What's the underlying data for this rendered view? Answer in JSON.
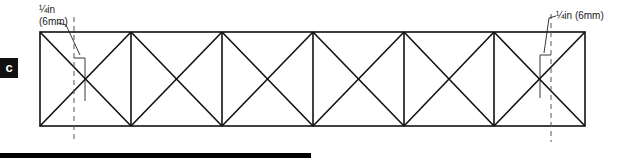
{
  "step_label": "c",
  "annotations": {
    "left": {
      "line1": "¼in",
      "line2": "(6mm)"
    },
    "right": {
      "text": "¼in (6mm)"
    }
  },
  "diagram": {
    "panels": 6,
    "stroke_color": "#111111",
    "dashed_color": "#555555"
  }
}
